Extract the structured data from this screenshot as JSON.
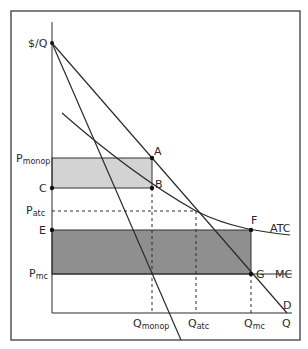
{
  "diagram": {
    "type": "monopoly-natural-monopoly-pricing",
    "axes": {
      "y_label": "$/Q",
      "x_label": "Q"
    },
    "curves": {
      "demand": "D",
      "atc": "ATC",
      "mc": "MC",
      "mr": ""
    },
    "price_labels": {
      "p_monop": {
        "main": "P",
        "sub": "monop"
      },
      "c": "C",
      "p_atc": {
        "main": "P",
        "sub": "atc"
      },
      "e": "E",
      "p_mc": {
        "main": "P",
        "sub": "mc"
      }
    },
    "quantity_labels": {
      "q_monop": {
        "main": "Q",
        "sub": "monop"
      },
      "q_atc": {
        "main": "Q",
        "sub": "atc"
      },
      "q_mc": {
        "main": "Q",
        "sub": "mc"
      }
    },
    "points": {
      "a": "A",
      "b": "B",
      "f": "F",
      "g": "G"
    },
    "colors": {
      "profit_area": "#d3d3d3",
      "loss_area": "#8f8f8f",
      "lines": "#2a2a2a",
      "frame": "#555555"
    }
  }
}
